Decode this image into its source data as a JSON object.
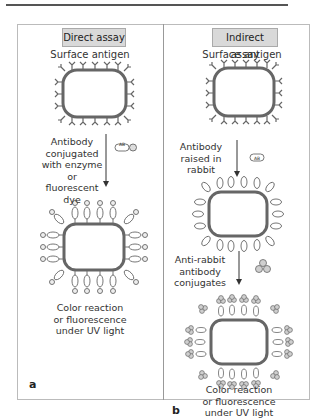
{
  "figure": {
    "panels": [
      {
        "id": "a",
        "title": "Direct assay",
        "surface_antigen_label": "Surface antigen",
        "step1_label_lines": [
          "Antibody",
          "conjugated",
          "with enzyme or",
          "fluorescent dye"
        ],
        "step1_reagent_label": "AB",
        "result_label_lines": [
          "Color reaction",
          "or fluorescence",
          "under UV light"
        ],
        "panel_letter": "a"
      },
      {
        "id": "b",
        "title": "Indirect assay",
        "surface_antigen_label": "Surface antigen",
        "step1_label_lines": [
          "Antibody",
          "raised in",
          "rabbit"
        ],
        "step1_reagent_label": "AB",
        "step2_label_lines": [
          "Anti-rabbit",
          "antibody",
          "conjugates"
        ],
        "result_label_lines": [
          "Color reaction",
          "or fluorescence",
          "under UV light"
        ],
        "panel_letter": "b"
      }
    ],
    "colors": {
      "cell_outline": "#666666",
      "title_bg": "#d9d9d9",
      "conjugate_fill": "#cfcfcf",
      "frame": "#bbbbbb"
    }
  }
}
